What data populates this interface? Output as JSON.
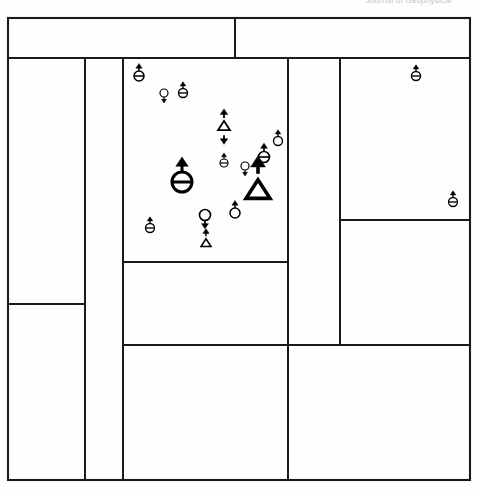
{
  "header": {
    "clipped_text": "Journal of Geophysical"
  },
  "figure": {
    "title": "",
    "background_color": "#fefefe",
    "line_color": "#1a1a1a",
    "symbol_color": "#000000",
    "frame": {
      "left": 8,
      "top": 18,
      "right": 470,
      "bottom": 480
    },
    "panels": [
      {
        "name": "top-left-banner",
        "x": 8,
        "y": 18,
        "w": 227,
        "h": 40
      },
      {
        "name": "top-right-banner",
        "x": 235,
        "y": 18,
        "w": 235,
        "h": 40
      },
      {
        "name": "left-upper-block",
        "x": 8,
        "y": 58,
        "w": 77,
        "h": 246
      },
      {
        "name": "left-lower-block",
        "x": 8,
        "y": 304,
        "w": 77,
        "h": 176
      },
      {
        "name": "left-narrow-strip",
        "x": 85,
        "y": 58,
        "w": 38,
        "h": 422
      },
      {
        "name": "center-symbol-panel",
        "x": 123,
        "y": 58,
        "w": 165,
        "h": 204
      },
      {
        "name": "center-middle-panel",
        "x": 123,
        "y": 262,
        "w": 165,
        "h": 83
      },
      {
        "name": "center-lower-panel",
        "x": 123,
        "y": 345,
        "w": 165,
        "h": 135
      },
      {
        "name": "mid-right-column",
        "x": 288,
        "y": 58,
        "w": 52,
        "h": 287
      },
      {
        "name": "right-upper-panel",
        "x": 340,
        "y": 58,
        "w": 130,
        "h": 162
      },
      {
        "name": "right-middle-panel",
        "x": 340,
        "y": 220,
        "w": 130,
        "h": 125
      },
      {
        "name": "bottom-right-panel",
        "x": 288,
        "y": 345,
        "w": 182,
        "h": 135
      }
    ],
    "dividers": [
      {
        "name": "banner-split-vertical",
        "orientation": "vertical",
        "x": 235,
        "y1": 18,
        "y2": 58
      },
      {
        "name": "banner-bottom-horizontal",
        "orientation": "horizontal",
        "y": 58,
        "x1": 8,
        "x2": 470
      },
      {
        "name": "left-column-vertical",
        "orientation": "vertical",
        "x": 85,
        "y1": 58,
        "y2": 480
      },
      {
        "name": "left-block-horizontal",
        "orientation": "horizontal",
        "y": 304,
        "x1": 8,
        "x2": 85
      },
      {
        "name": "center-panel-vertical",
        "orientation": "vertical",
        "x": 123,
        "y1": 58,
        "y2": 480
      },
      {
        "name": "center-panel-horizontal-1",
        "orientation": "horizontal",
        "y": 262,
        "x1": 123,
        "x2": 288
      },
      {
        "name": "center-panel-horizontal-2",
        "orientation": "horizontal",
        "y": 345,
        "x1": 123,
        "x2": 470
      },
      {
        "name": "mid-right-vertical",
        "orientation": "vertical",
        "x": 288,
        "y1": 58,
        "y2": 480
      },
      {
        "name": "right-column-vertical",
        "orientation": "vertical",
        "x": 340,
        "y1": 58,
        "y2": 345
      },
      {
        "name": "right-panel-horizontal",
        "orientation": "horizontal",
        "y": 220,
        "x1": 340,
        "x2": 470
      }
    ],
    "symbols": [
      {
        "name": "symbol-barred-circle-up-1",
        "type": "barred-circle",
        "arrow_up": true,
        "arrow_down": false,
        "size": 5.0,
        "x": 139,
        "y": 76
      },
      {
        "name": "symbol-circle-down-1",
        "type": "circle",
        "arrow_up": false,
        "arrow_down": true,
        "size": 4.0,
        "x": 164,
        "y": 93
      },
      {
        "name": "symbol-barred-circle-up-2",
        "type": "barred-circle",
        "arrow_up": true,
        "arrow_down": false,
        "size": 4.5,
        "x": 183,
        "y": 93
      },
      {
        "name": "symbol-triangle-updown-1",
        "type": "triangle",
        "arrow_up": true,
        "arrow_down": true,
        "size": 6.0,
        "x": 224,
        "y": 126
      },
      {
        "name": "symbol-barred-circle-up-3",
        "type": "barred-circle",
        "arrow_up": true,
        "arrow_down": false,
        "size": 4.0,
        "x": 224,
        "y": 163
      },
      {
        "name": "symbol-circle-down-2",
        "type": "circle",
        "arrow_up": false,
        "arrow_down": true,
        "size": 4.0,
        "x": 245,
        "y": 166
      },
      {
        "name": "symbol-barred-circle-up-4",
        "type": "barred-circle",
        "arrow_up": true,
        "arrow_down": false,
        "size": 5.5,
        "x": 264,
        "y": 157
      },
      {
        "name": "symbol-circle-up-1",
        "type": "circle",
        "arrow_up": true,
        "arrow_down": false,
        "size": 4.5,
        "x": 278,
        "y": 141
      },
      {
        "name": "symbol-barred-circle-up-big",
        "type": "barred-circle",
        "arrow_up": true,
        "arrow_down": false,
        "size": 10.0,
        "x": 182,
        "y": 182
      },
      {
        "name": "symbol-triangle-up-big",
        "type": "triangle",
        "arrow_up": true,
        "arrow_down": false,
        "size": 12.0,
        "x": 258,
        "y": 190
      },
      {
        "name": "symbol-barred-circle-up-5",
        "type": "barred-circle",
        "arrow_up": true,
        "arrow_down": false,
        "size": 4.5,
        "x": 150,
        "y": 228
      },
      {
        "name": "symbol-circle-down-3",
        "type": "circle",
        "arrow_up": false,
        "arrow_down": true,
        "size": 5.5,
        "x": 205,
        "y": 215
      },
      {
        "name": "symbol-circle-up-2",
        "type": "circle",
        "arrow_up": true,
        "arrow_down": false,
        "size": 5.0,
        "x": 235,
        "y": 213
      },
      {
        "name": "symbol-triangle-up-small",
        "type": "triangle",
        "arrow_up": true,
        "arrow_down": false,
        "size": 5.0,
        "x": 206,
        "y": 243
      },
      {
        "name": "symbol-barred-circle-up-6",
        "type": "barred-circle",
        "arrow_up": true,
        "arrow_down": false,
        "size": 4.5,
        "x": 416,
        "y": 76
      },
      {
        "name": "symbol-barred-circle-up-7",
        "type": "barred-circle",
        "arrow_up": true,
        "arrow_down": false,
        "size": 4.5,
        "x": 453,
        "y": 202
      }
    ]
  }
}
